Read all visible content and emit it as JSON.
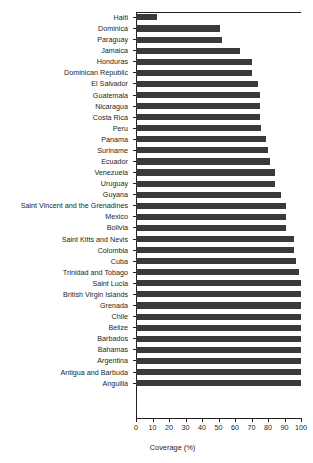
{
  "chart_data": {
    "type": "bar",
    "orientation": "horizontal",
    "title": "",
    "xlabel": "Coverage (%)",
    "ylabel": "",
    "xlim": [
      0,
      100
    ],
    "xticks": [
      0,
      10,
      20,
      30,
      40,
      50,
      60,
      70,
      80,
      90,
      100
    ],
    "grid": false,
    "legend": null,
    "bar_color": "#3a3a3a",
    "axis_color": "#231f20",
    "background": "#ffffff",
    "categories": [
      "Haiti",
      "Dominica",
      "Paraguay",
      "Jamaica",
      "Honduras",
      "Dominican Republic",
      "El Salvador",
      "Guatemala",
      "Nicaragua",
      "Costa Rica",
      "Peru",
      "Panama",
      "Suriname",
      "Ecuador",
      "Venezuela",
      "Uruguay",
      "Guyana",
      "Saint Vincent and the Grenadines",
      "Mexico",
      "Bolivia",
      "Saint Kitts and Nevis",
      "Colombia",
      "Cuba",
      "Trinidad and Tobago",
      "Saint Lucia",
      "British Virgin Islands",
      "Grenada",
      "Chile",
      "Belize",
      "Barbados",
      "Bahamas",
      "Argentina",
      "Antigua and Barbuda",
      "Anguilla"
    ],
    "values": [
      13,
      51,
      52,
      63,
      70,
      70,
      74,
      75,
      75,
      75,
      76,
      79,
      80,
      81,
      84,
      84,
      88,
      91,
      91,
      91,
      96,
      96,
      97,
      99,
      100,
      100,
      100,
      100,
      100,
      100,
      100,
      100,
      100,
      100
    ]
  }
}
